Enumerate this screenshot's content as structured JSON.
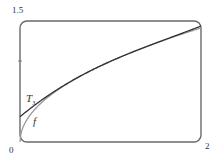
{
  "chart_data": {
    "type": "line",
    "title": "",
    "xlabel": "",
    "ylabel": "",
    "xlim": [
      0,
      2
    ],
    "ylim": [
      0,
      1.5
    ],
    "x_tick_labels": [
      "0",
      "2"
    ],
    "y_tick_labels": [
      "1.5"
    ],
    "grid": false,
    "series": [
      {
        "name": "f",
        "label": "f",
        "function": "sqrt(x)",
        "color": "#9a9a9a",
        "x": [
          0,
          0.1,
          0.25,
          0.5,
          0.75,
          1,
          1.25,
          1.5,
          1.75,
          2
        ],
        "values": [
          0,
          0.316,
          0.5,
          0.707,
          0.866,
          1,
          1.118,
          1.225,
          1.323,
          1.414
        ]
      },
      {
        "name": "T3",
        "label": "T",
        "label_sub": "3",
        "function": "Taylor cubic of sqrt(x) at x=1",
        "color": "#333333",
        "x": [
          0,
          0.25,
          0.5,
          0.75,
          1,
          1.25,
          1.5,
          1.75,
          2
        ],
        "values": [
          0.3125,
          0.533,
          0.711,
          0.866,
          1,
          1.118,
          1.227,
          1.324,
          1.438
        ]
      }
    ]
  },
  "labels": {
    "y_top": "1.5",
    "origin": "0",
    "x_right": "2",
    "f": "f",
    "T": "T",
    "T_sub": "3"
  },
  "colors": {
    "frame": "#6a6a6a",
    "f": "#9a9a9a",
    "T3": "#333333"
  }
}
